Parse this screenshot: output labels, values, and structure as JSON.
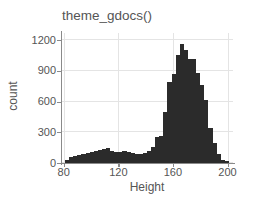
{
  "chart_data": {
    "type": "bar",
    "title": "theme_gdocs()",
    "xlabel": "Height",
    "ylabel": "count",
    "xlim": [
      78,
      204
    ],
    "ylim": [
      0,
      1270
    ],
    "grid": true,
    "legend": "none",
    "xticks": [
      80,
      120,
      160,
      200
    ],
    "xtick_labels": [
      "80",
      "120",
      "160",
      "200"
    ],
    "yticks": [
      0,
      300,
      600,
      900,
      1200
    ],
    "ytick_labels": [
      "0",
      "300",
      "600",
      "900",
      "1200"
    ],
    "bar_color": "#2b2b2b",
    "grid_color": "#e4e4e4",
    "axis_color": "#8a8a8a",
    "text_color": "#555555",
    "bin_width": 3,
    "bin_starts": [
      81,
      84,
      87,
      90,
      93,
      96,
      99,
      102,
      105,
      108,
      111,
      114,
      117,
      120,
      123,
      126,
      129,
      132,
      135,
      138,
      141,
      144,
      147,
      150,
      153,
      156,
      159,
      162,
      165,
      168,
      171,
      174,
      177,
      180,
      183,
      186,
      189,
      192,
      195,
      198
    ],
    "categories": [
      "81",
      "84",
      "87",
      "90",
      "93",
      "96",
      "99",
      "102",
      "105",
      "108",
      "111",
      "114",
      "117",
      "120",
      "123",
      "126",
      "129",
      "132",
      "135",
      "138",
      "141",
      "144",
      "147",
      "150",
      "153",
      "156",
      "159",
      "162",
      "165",
      "168",
      "171",
      "174",
      "177",
      "180",
      "183",
      "186",
      "189",
      "192",
      "195",
      "198"
    ],
    "values": [
      30,
      55,
      70,
      75,
      85,
      100,
      110,
      120,
      130,
      140,
      145,
      115,
      105,
      110,
      115,
      110,
      95,
      85,
      90,
      100,
      120,
      155,
      250,
      265,
      500,
      790,
      870,
      1060,
      1160,
      1105,
      1020,
      1015,
      880,
      760,
      620,
      345,
      195,
      90,
      30,
      15
    ]
  }
}
